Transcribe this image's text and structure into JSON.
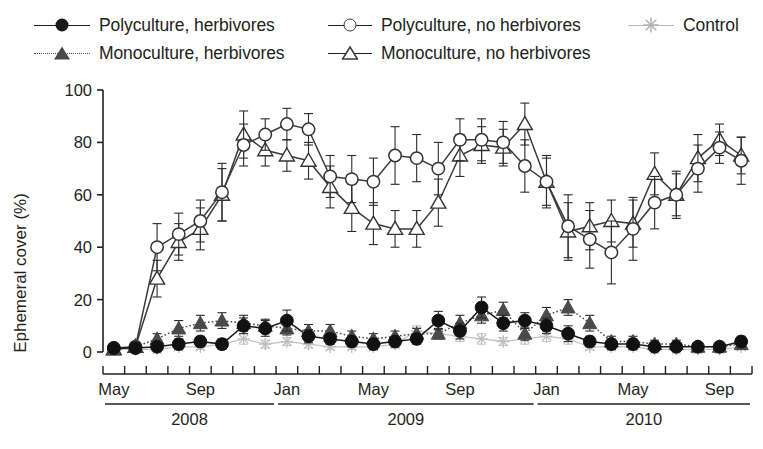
{
  "legend": {
    "items": [
      {
        "label": "Polyculture, herbivores",
        "marker": "filled-circle",
        "line": "solid",
        "color": "#1a1a1a"
      },
      {
        "label": "Monoculture, herbivores",
        "marker": "filled-triangle",
        "line": "dotted",
        "color": "#4a4a4a"
      },
      {
        "label": "Polyculture, no herbivores",
        "marker": "open-circle",
        "line": "solid",
        "color": "#3a3a3a"
      },
      {
        "label": "Monoculture, no herbivores",
        "marker": "open-triangle",
        "line": "solid",
        "color": "#3a3a3a"
      },
      {
        "label": "Control",
        "marker": "star",
        "line": "faint",
        "color": "#b8b8b8"
      }
    ]
  },
  "chart_data": {
    "type": "line",
    "title": "",
    "xlabel": "",
    "ylabel": "Ephemeral cover (%)",
    "ylim": [
      0,
      100
    ],
    "yticks": [
      0,
      20,
      40,
      60,
      80,
      100
    ],
    "grid": false,
    "legend_position": "top",
    "x_axis": {
      "month_labels": [
        {
          "text": "May",
          "index": 0
        },
        {
          "text": "Sep",
          "index": 4
        },
        {
          "text": "Jan",
          "index": 8
        },
        {
          "text": "May",
          "index": 12
        },
        {
          "text": "Sep",
          "index": 16
        },
        {
          "text": "Jan",
          "index": 20
        },
        {
          "text": "May",
          "index": 24
        },
        {
          "text": "Sep",
          "index": 28
        }
      ],
      "year_groups": [
        {
          "label": "2008",
          "start": 0,
          "end": 7
        },
        {
          "label": "2009",
          "start": 8,
          "end": 19
        },
        {
          "label": "2010",
          "start": 20,
          "end": 29
        }
      ],
      "n_ticks": 30
    },
    "x": [
      0,
      1,
      2,
      3,
      4,
      5,
      6,
      7,
      8,
      9,
      10,
      11,
      12,
      13,
      14,
      15,
      16,
      17,
      18,
      19,
      20,
      21,
      22,
      23,
      24,
      25,
      26,
      27,
      28,
      29
    ],
    "series": [
      {
        "name": "Polyculture, herbivores",
        "marker": "filled-circle",
        "line": "solid",
        "color": "#1a1a1a",
        "values": [
          1.5,
          1.5,
          2,
          3,
          4,
          3,
          10,
          9,
          12,
          6,
          5,
          4,
          3,
          4,
          5,
          12,
          8,
          17,
          11,
          12,
          10,
          7,
          4,
          3,
          3,
          2,
          2,
          2,
          2,
          4
        ],
        "errors": [
          1,
          1.5,
          1.5,
          2,
          2,
          2,
          3,
          3,
          4,
          2.5,
          2,
          2,
          2,
          2,
          2,
          3.5,
          3,
          4,
          3,
          3,
          3,
          3,
          2,
          2,
          2,
          1.5,
          1.5,
          1.5,
          1.5,
          2
        ]
      },
      {
        "name": "Monoculture, herbivores",
        "marker": "filled-triangle",
        "line": "dotted",
        "color": "#4a4a4a",
        "values": [
          1,
          2,
          5,
          9,
          11,
          12,
          11,
          10,
          9,
          8,
          8,
          6,
          5,
          6,
          7,
          7,
          11,
          14,
          16,
          7,
          14,
          17,
          11,
          4,
          4,
          3,
          3,
          2,
          2,
          3
        ],
        "errors": [
          1,
          1.5,
          2,
          3,
          3,
          3,
          3,
          2.5,
          2.5,
          2.5,
          2.5,
          2,
          2,
          2,
          2,
          2,
          3,
          3,
          3,
          2.5,
          3,
          3,
          3,
          2,
          2,
          1.5,
          1.5,
          1.5,
          1.5,
          2
        ]
      },
      {
        "name": "Polyculture, no herbivores",
        "marker": "open-circle",
        "line": "solid",
        "color": "#3a3a3a",
        "values": [
          1.5,
          2,
          40,
          45,
          50,
          61,
          79,
          83,
          87,
          85,
          67,
          66,
          65,
          75,
          74,
          70,
          81,
          81,
          80,
          71,
          65,
          48,
          43,
          38,
          47,
          57,
          60,
          70,
          78,
          73
        ],
        "errors": [
          1,
          1.5,
          9,
          8,
          8,
          11,
          8,
          6,
          6,
          6,
          8,
          9,
          9,
          11,
          9,
          10,
          8,
          8,
          8,
          10,
          10,
          12,
          11,
          12,
          12,
          10,
          9,
          9,
          6,
          9
        ]
      },
      {
        "name": "Monoculture, no herbivores",
        "marker": "open-triangle",
        "line": "solid",
        "color": "#3a3a3a",
        "values": [
          1,
          2,
          28,
          42,
          47,
          60,
          83,
          77,
          75,
          73,
          63,
          55,
          49,
          47,
          47,
          57,
          75,
          79,
          78,
          87,
          65,
          46,
          48,
          50,
          49,
          68,
          60,
          74,
          81,
          75
        ],
        "errors": [
          1,
          1.5,
          7,
          7,
          8,
          10,
          9,
          6,
          6,
          7,
          8,
          9,
          8,
          7,
          7,
          9,
          8,
          7,
          7,
          8,
          9,
          11,
          9,
          8,
          9,
          8,
          8,
          9,
          6,
          7
        ]
      },
      {
        "name": "Control",
        "marker": "star",
        "line": "faint",
        "color": "#b8b8b8",
        "values": [
          1,
          1,
          1,
          2,
          2,
          3,
          5,
          3,
          4,
          3,
          2,
          2,
          2,
          3,
          8,
          7,
          6,
          5,
          4,
          5,
          6,
          5,
          2,
          2,
          2,
          1,
          1,
          1,
          1,
          2
        ],
        "errors": [
          0.5,
          0.5,
          0.5,
          1,
          1,
          1,
          2,
          1.5,
          1.5,
          1.5,
          1,
          1,
          1,
          1.5,
          2,
          2,
          2,
          2,
          1.5,
          2,
          2,
          2,
          1,
          1,
          1,
          0.5,
          0.5,
          0.5,
          0.5,
          1
        ]
      }
    ]
  }
}
